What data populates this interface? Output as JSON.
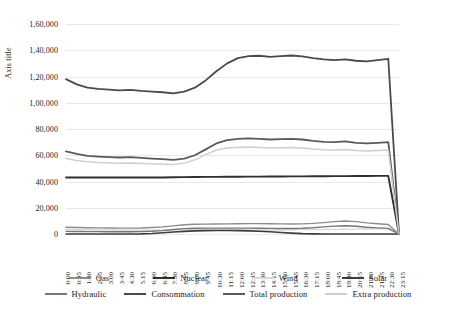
{
  "chart_data": {
    "type": "line",
    "title": "",
    "xlabel": "",
    "ylabel": "Axis title",
    "ylim": [
      0,
      160000
    ],
    "ytick_labels": [
      "1,60,000",
      "1,40,000",
      "1,20,000",
      "1,00,000",
      "80,000",
      "60,000",
      "40,000",
      "20,000",
      "0"
    ],
    "ytick_values": [
      160000,
      140000,
      120000,
      100000,
      80000,
      60000,
      40000,
      20000,
      0
    ],
    "grid": true,
    "legend_position": "bottom",
    "x": [
      "0:00",
      "0:45",
      "1:30",
      "2:15",
      "3:00",
      "3:45",
      "4:30",
      "5:15",
      "6:00",
      "6:45",
      "7:30",
      "8:15",
      "9:00",
      "9:45",
      "10:30",
      "11:15",
      "12:00",
      "12:45",
      "13:30",
      "14:15",
      "15:00",
      "15:45",
      "16:30",
      "17:15",
      "18:00",
      "18:45",
      "19:30",
      "20:15",
      "21:00",
      "21:45",
      "22:30",
      "23:15"
    ],
    "series": [
      {
        "name": "Gas",
        "color": "#8c8c8c",
        "width": 1.4,
        "values": [
          5200,
          5000,
          4800,
          4700,
          4600,
          4500,
          4500,
          4600,
          5000,
          5400,
          6200,
          7000,
          7400,
          7500,
          7600,
          7700,
          7800,
          7900,
          7900,
          7800,
          7700,
          7600,
          7700,
          8100,
          8700,
          9400,
          9900,
          9400,
          8500,
          7800,
          7200,
          0
        ]
      },
      {
        "name": "Nuclear",
        "color": "#2f2f2f",
        "width": 1.9,
        "values": [
          43000,
          43000,
          43000,
          43000,
          43000,
          43000,
          43000,
          43000,
          43000,
          43100,
          43200,
          43300,
          43400,
          43500,
          43500,
          43600,
          43600,
          43700,
          43700,
          43800,
          43800,
          43900,
          43900,
          44000,
          44000,
          44100,
          44100,
          44200,
          44200,
          44300,
          44300,
          0
        ]
      },
      {
        "name": "Wind",
        "color": "#d9d9d9",
        "width": 1.4,
        "values": [
          3400,
          3300,
          3200,
          3100,
          3000,
          3000,
          2900,
          2900,
          2900,
          3000,
          3200,
          3400,
          3500,
          3500,
          3400,
          3300,
          3200,
          3100,
          3000,
          3000,
          3100,
          3200,
          3300,
          3300,
          3400,
          3500,
          3600,
          3700,
          3800,
          3900,
          4000,
          0
        ]
      },
      {
        "name": "Solar",
        "color": "#3d3d3d",
        "width": 1.6,
        "values": [
          0,
          0,
          0,
          0,
          0,
          0,
          0,
          100,
          400,
          900,
          1500,
          2000,
          2400,
          2600,
          2700,
          2700,
          2600,
          2400,
          2100,
          1700,
          1200,
          700,
          300,
          100,
          0,
          0,
          0,
          0,
          0,
          0,
          0,
          0
        ]
      },
      {
        "name": "Hydraulic",
        "color": "#777777",
        "width": 1.4,
        "values": [
          2000,
          1900,
          1800,
          1800,
          1700,
          1700,
          1700,
          1800,
          2100,
          2600,
          3400,
          4100,
          4400,
          4500,
          4500,
          4500,
          4500,
          4500,
          4400,
          4300,
          4200,
          4200,
          4400,
          4800,
          5400,
          6000,
          6300,
          5900,
          5200,
          4700,
          4300,
          0
        ]
      },
      {
        "name": "Consommation",
        "color": "#4a4a4a",
        "width": 1.8,
        "values": [
          118000,
          114000,
          111500,
          110500,
          110000,
          109500,
          109800,
          109000,
          108500,
          108000,
          107200,
          108500,
          111500,
          117000,
          124000,
          130000,
          134000,
          135500,
          135800,
          135000,
          135500,
          136000,
          135300,
          134000,
          133000,
          132500,
          133000,
          132000,
          131500,
          132500,
          133500,
          0
        ]
      },
      {
        "name": "Total production",
        "color": "#5a5a5a",
        "width": 1.8,
        "values": [
          63000,
          61000,
          59500,
          59000,
          58600,
          58300,
          58500,
          58000,
          57500,
          57000,
          56500,
          57500,
          60000,
          64500,
          69000,
          71500,
          72500,
          72800,
          72500,
          72000,
          72300,
          72500,
          72000,
          71000,
          70200,
          70000,
          70500,
          69500,
          69000,
          69500,
          70000,
          0
        ]
      },
      {
        "name": "Extra production",
        "color": "#cfcfcf",
        "width": 1.5,
        "values": [
          57500,
          56000,
          55000,
          54500,
          54200,
          54000,
          54100,
          53800,
          53500,
          53200,
          53000,
          54000,
          56500,
          60500,
          64000,
          65500,
          66000,
          66200,
          66000,
          65600,
          65800,
          66000,
          65600,
          64800,
          64200,
          64000,
          64400,
          63600,
          63200,
          63600,
          64000,
          0
        ]
      }
    ],
    "consommation_detail": {
      "note": "evening peak ~141,000 near 19:00-19:30; all series drop to 0 at 23:15"
    }
  },
  "legend": {
    "rows": [
      [
        {
          "label": "Gas",
          "color": "#8c8c8c"
        },
        {
          "label": "Nuclear",
          "color": "#2f2f2f"
        },
        {
          "label": "Wind",
          "color": "#d9d9d9"
        },
        {
          "label": "Solar",
          "color": "#3d3d3d"
        }
      ],
      [
        {
          "label": "Hydraulic",
          "color": "#777777"
        },
        {
          "label": "Consommation",
          "color": "#4a4a4a"
        },
        {
          "label": "Total production",
          "color": "#5a5a5a"
        },
        {
          "label": "Extra production",
          "color": "#cfcfcf"
        }
      ]
    ]
  }
}
